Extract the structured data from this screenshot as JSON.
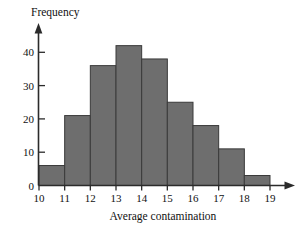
{
  "chart_data": {
    "type": "bar",
    "title": "",
    "subtitle": "",
    "xlabel": "Average contamination",
    "ylabel": "Frequency",
    "categories": [
      "10-11",
      "11-12",
      "12-13",
      "13-14",
      "14-15",
      "15-16",
      "16-17",
      "17-18",
      "18-19"
    ],
    "bin_edges": [
      10,
      11,
      12,
      13,
      14,
      15,
      16,
      17,
      18,
      19
    ],
    "values": [
      6,
      21,
      36,
      42,
      38,
      25,
      18,
      11,
      3
    ],
    "x_tick_labels": [
      "10",
      "11",
      "12",
      "13",
      "14",
      "15",
      "16",
      "17",
      "18",
      "19"
    ],
    "y_tick_labels": [
      "0",
      "10",
      "20",
      "30",
      "40"
    ],
    "y_tick_values": [
      0,
      10,
      20,
      30,
      40
    ],
    "xlim": [
      10,
      19
    ],
    "ylim": [
      0,
      45
    ],
    "grid": false,
    "legend": null,
    "legend_position": "none",
    "annotations": [],
    "bar_fill_color": "#6e6e6e",
    "bar_edge_color": "#3a3a3a",
    "axis_color": "#2b2b2b",
    "background_color": "#ffffff"
  },
  "figure": {
    "y_axis_title": "Frequency",
    "x_axis_title": "Average contamination"
  }
}
